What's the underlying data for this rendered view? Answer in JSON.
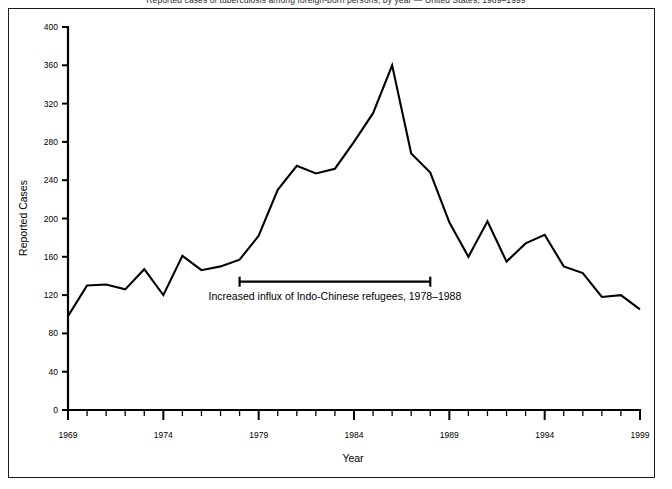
{
  "figure": {
    "title_clipped": "Reported cases of tuberculosis among foreign-born persons, by year — United States, 1969–1999",
    "background": "#ffffff",
    "line_color": "#000000",
    "frame_color": "#1a1a1a"
  },
  "chart_data": {
    "type": "line",
    "title": "",
    "xlabel": "Year",
    "ylabel": "Reported Cases",
    "xlim": [
      1969,
      1999
    ],
    "ylim": [
      0,
      400
    ],
    "grid": false,
    "legend": "none",
    "x_major_ticks": [
      1969,
      1974,
      1979,
      1984,
      1989,
      1994,
      1999
    ],
    "x_tick_labels": [
      "1969",
      "1974",
      "1979",
      "1984",
      "1989",
      "1994",
      "1999"
    ],
    "x_minor_tick_step": 1,
    "y_ticks": [
      0,
      40,
      80,
      120,
      160,
      200,
      240,
      280,
      320,
      360,
      400
    ],
    "y_tick_labels": [
      "0",
      "40",
      "80",
      "120",
      "160",
      "200",
      "240",
      "280",
      "320",
      "360",
      "400"
    ],
    "x": [
      1969,
      1970,
      1971,
      1972,
      1973,
      1974,
      1975,
      1976,
      1977,
      1978,
      1979,
      1980,
      1981,
      1982,
      1983,
      1984,
      1985,
      1986,
      1987,
      1988,
      1989,
      1990,
      1991,
      1992,
      1993,
      1994,
      1995,
      1996,
      1997,
      1998,
      1999
    ],
    "values": [
      98,
      130,
      131,
      126,
      147,
      120,
      161,
      146,
      150,
      157,
      182,
      230,
      255,
      247,
      252,
      280,
      310,
      360,
      268,
      248,
      196,
      160,
      197,
      155,
      174,
      183,
      150,
      143,
      118,
      120,
      105
    ],
    "series": [
      {
        "name": "Reported Cases",
        "values": [
          98,
          130,
          131,
          126,
          147,
          120,
          161,
          146,
          150,
          157,
          182,
          230,
          255,
          247,
          252,
          280,
          310,
          360,
          268,
          248,
          196,
          160,
          197,
          155,
          174,
          183,
          150,
          143,
          118,
          120,
          105
        ]
      }
    ],
    "annotations": [
      {
        "text": "Increased influx of Indo-Chinese refugees, 1978–1988",
        "bar_start_year": 1978,
        "bar_end_year": 1988,
        "bar_value": 134,
        "text_value": 115
      }
    ]
  }
}
